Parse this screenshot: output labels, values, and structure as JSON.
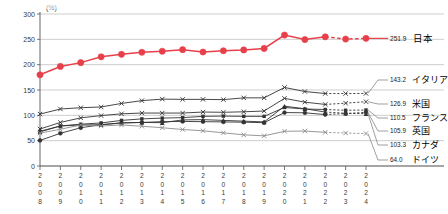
{
  "axes": {
    "unit_label": "(%)",
    "y_ticks": [
      0,
      50,
      100,
      150,
      200,
      250,
      300
    ],
    "x_ticks": [
      "2008",
      "2009",
      "2010",
      "2011",
      "2012",
      "2013",
      "2014",
      "2015",
      "2016",
      "2017",
      "2018",
      "2019",
      "2020",
      "2021",
      "2022",
      "2023",
      "2024"
    ]
  },
  "legend": [
    {
      "value": "251.9",
      "name": "日本"
    },
    {
      "value": "143.2",
      "name": "イタリア"
    },
    {
      "value": "126.9",
      "name": "米国"
    },
    {
      "value": "110.5",
      "name": "フランス"
    },
    {
      "value": "105.9",
      "name": "英国"
    },
    {
      "value": "103.3",
      "name": "カナダ"
    },
    {
      "value": "64.0",
      "name": "ドイツ"
    }
  ],
  "colors": {
    "japan": "#e8404a",
    "others": "#333333",
    "grid": "#b9b9b9",
    "axis": "#555555"
  },
  "chart_data": {
    "type": "line",
    "title": "",
    "xlabel": "",
    "ylabel": "(%)",
    "ylim": [
      0,
      300
    ],
    "grid": true,
    "legend_position": "right-labels",
    "x": [
      "2008",
      "2009",
      "2010",
      "2011",
      "2012",
      "2013",
      "2014",
      "2015",
      "2016",
      "2017",
      "2018",
      "2019",
      "2020",
      "2021",
      "2022",
      "2023",
      "2024"
    ],
    "forecast_from": "2022",
    "series": [
      {
        "name": "日本",
        "label_value": 251.9,
        "color": "#e8404a",
        "marker": "circle",
        "values": [
          180.0,
          196.5,
          204.0,
          215.5,
          220.5,
          224.5,
          226.5,
          229.5,
          225.0,
          227.5,
          229.0,
          232.0,
          258.5,
          249.5,
          255.0,
          250.5,
          251.9
        ]
      },
      {
        "name": "イタリア",
        "label_value": 143.2,
        "color": "#333333",
        "marker": "x",
        "values": [
          102.5,
          112.5,
          115.0,
          116.5,
          123.5,
          129.0,
          132.0,
          131.5,
          131.5,
          131.0,
          134.5,
          134.5,
          155.0,
          147.0,
          143.0,
          143.0,
          143.2
        ]
      },
      {
        "name": "米国",
        "label_value": 126.9,
        "color": "#333333",
        "marker": "x",
        "values": [
          73.0,
          86.0,
          95.0,
          99.5,
          103.0,
          104.5,
          104.5,
          104.5,
          106.5,
          106.0,
          107.0,
          108.5,
          133.5,
          126.0,
          121.5,
          124.0,
          126.9
        ]
      },
      {
        "name": "フランス",
        "label_value": 110.5,
        "color": "#333333",
        "marker": "square",
        "values": [
          68.5,
          79.0,
          82.5,
          85.0,
          90.0,
          93.0,
          94.5,
          95.5,
          98.0,
          98.5,
          98.0,
          98.0,
          115.5,
          112.5,
          111.5,
          110.0,
          110.5
        ]
      },
      {
        "name": "英国",
        "label_value": 105.9,
        "color": "#333333",
        "marker": "circle",
        "values": [
          50.5,
          64.5,
          75.5,
          81.5,
          85.0,
          86.0,
          87.5,
          88.0,
          87.5,
          87.0,
          86.5,
          85.5,
          105.5,
          105.0,
          101.5,
          103.5,
          105.9
        ]
      },
      {
        "name": "カナダ",
        "label_value": 103.3,
        "color": "#333333",
        "marker": "triangle",
        "values": [
          67.5,
          79.0,
          81.0,
          81.5,
          85.0,
          86.0,
          85.5,
          91.0,
          91.5,
          90.0,
          88.5,
          87.0,
          118.0,
          113.0,
          106.5,
          104.0,
          103.3
        ]
      },
      {
        "name": "ドイツ",
        "label_value": 64.0,
        "color": "#8c8c8c",
        "marker": "x",
        "values": [
          65.0,
          72.5,
          81.0,
          79.0,
          81.0,
          78.5,
          75.5,
          72.0,
          69.5,
          65.5,
          61.5,
          59.5,
          68.5,
          69.0,
          66.5,
          65.0,
          64.0
        ]
      }
    ]
  }
}
